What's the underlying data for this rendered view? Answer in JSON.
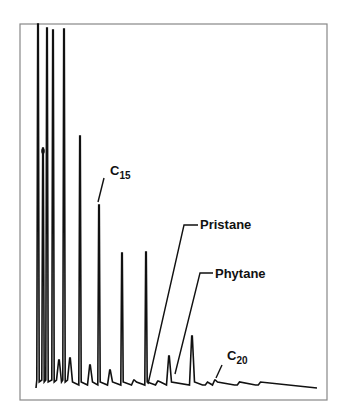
{
  "chart_data": {
    "type": "line",
    "subtype": "gas-chromatogram",
    "title": "",
    "xlabel": "",
    "ylabel": "",
    "grid": false,
    "legend": null,
    "frame": {
      "left": 20,
      "top": 24,
      "right": 327,
      "bottom": 400
    },
    "baseline_y": 388,
    "baseline_end_x": 317,
    "peaks": [
      {
        "x": 38,
        "top": 24
      },
      {
        "x": 43,
        "top": 148,
        "marker": true
      },
      {
        "x": 47,
        "top": 28
      },
      {
        "x": 53,
        "top": 30
      },
      {
        "x": 59,
        "top": 360
      },
      {
        "x": 64,
        "top": 29
      },
      {
        "x": 70,
        "top": 358
      },
      {
        "x": 80,
        "top": 136
      },
      {
        "x": 90,
        "top": 365
      },
      {
        "x": 99,
        "top": 205,
        "label": "C15"
      },
      {
        "x": 110,
        "top": 370
      },
      {
        "x": 122,
        "top": 253
      },
      {
        "x": 134,
        "top": 380
      },
      {
        "x": 146,
        "top": 252
      },
      {
        "x": 158,
        "top": 381,
        "label": "Pristane"
      },
      {
        "x": 169,
        "top": 356,
        "label": "Phytane"
      },
      {
        "x": 192,
        "top": 336
      },
      {
        "x": 205,
        "top": 385
      },
      {
        "x": 215,
        "top": 380,
        "label": "C20"
      },
      {
        "x": 237,
        "top": 385
      },
      {
        "x": 258,
        "top": 385
      }
    ],
    "annotations": [
      {
        "text": "C",
        "sub": "15",
        "x": 110,
        "y": 175,
        "leader": [
          [
            104,
            178
          ],
          [
            98,
            202
          ]
        ]
      },
      {
        "text": "Pristane",
        "x": 200,
        "y": 229,
        "leader": [
          [
            198,
            225
          ],
          [
            184,
            225
          ],
          [
            148,
            384
          ]
        ]
      },
      {
        "text": "Phytane",
        "x": 215,
        "y": 278,
        "leader": [
          [
            213,
            273
          ],
          [
            200,
            273
          ],
          [
            175,
            374
          ]
        ]
      },
      {
        "text": "C",
        "sub": "20",
        "x": 227,
        "y": 360,
        "leader": [
          [
            222,
            365
          ],
          [
            216,
            378
          ]
        ]
      }
    ]
  }
}
